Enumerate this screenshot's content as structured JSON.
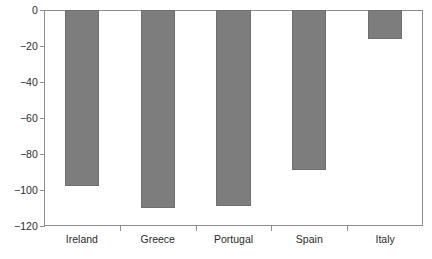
{
  "chart_data": {
    "type": "bar",
    "title": "",
    "subtitle": "",
    "xlabel": "",
    "ylabel": "",
    "categories": [
      "Ireland",
      "Greece",
      "Portugal",
      "Spain",
      "Italy"
    ],
    "values": [
      -98,
      -110,
      -109,
      -89,
      -16
    ],
    "series": [
      {
        "name": "",
        "values": [
          -98,
          -110,
          -109,
          -89,
          -16
        ]
      }
    ],
    "ylim": [
      -120,
      0
    ],
    "xlim": [
      0,
      5
    ],
    "ytick_labels": [
      "0",
      "−20",
      "−40",
      "−60",
      "−80",
      "−100",
      "−120"
    ],
    "ytick_values": [
      0,
      -20,
      -40,
      -60,
      -80,
      -100,
      -120
    ],
    "ytick_interval": 20,
    "grid": false,
    "legend": false,
    "legend_position": "none",
    "annotations": [],
    "bar_color": "#7d7d7d",
    "bar_edge_color": "#6f6f6f",
    "axis_color": "#8d8d8d",
    "text_color": "#2b2b2b",
    "background_color": "#ffffff",
    "bar_width_fraction": 0.45,
    "orientation": "vertical",
    "value_direction": "negative-downward-from-zero"
  }
}
